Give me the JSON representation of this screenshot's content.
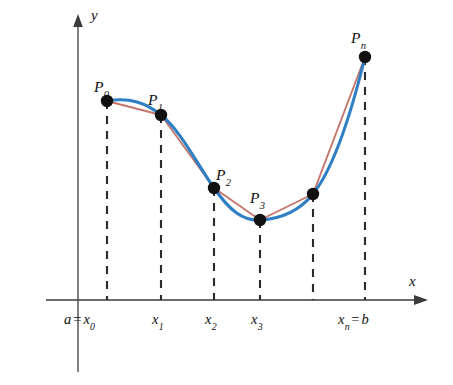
{
  "figure": {
    "background_color": "#ffffff",
    "axis_color": "#3b3b3b",
    "curve_color": "#2f7fc4",
    "chord_color": "#c4766a",
    "point_color": "#111111",
    "dash_color": "#2b2b2b"
  },
  "axes": {
    "y_label": "y",
    "x_label": "x",
    "origin_px": {
      "x": 78,
      "y": 300
    },
    "x_axis_end_px": 425,
    "y_axis_top_px": 18,
    "y_axis_bottom_px": 372
  },
  "points": [
    {
      "name": "P0",
      "label_base": "P",
      "label_sub": "0",
      "x": 107,
      "y": 101,
      "label_x": 94,
      "label_y": 79,
      "labeled": true
    },
    {
      "name": "P1",
      "label_base": "P",
      "label_sub": "1",
      "x": 161,
      "y": 115,
      "label_x": 148,
      "label_y": 92,
      "labeled": true
    },
    {
      "name": "P2",
      "label_base": "P",
      "label_sub": "2",
      "x": 214,
      "y": 188,
      "label_x": 216,
      "label_y": 167,
      "labeled": true
    },
    {
      "name": "P3",
      "label_base": "P",
      "label_sub": "3",
      "x": 260,
      "y": 220,
      "label_x": 250,
      "label_y": 190,
      "labeled": true
    },
    {
      "name": "P4",
      "label_base": "",
      "label_sub": "",
      "x": 313,
      "y": 194,
      "label_x": 0,
      "label_y": 0,
      "labeled": false
    },
    {
      "name": "Pn",
      "label_base": "P",
      "label_sub": "n",
      "x": 365,
      "y": 57,
      "label_x": 351,
      "label_y": 30,
      "labeled": true
    }
  ],
  "x_ticks": [
    {
      "name": "tick-x0",
      "prefix": "a",
      "equals": "=",
      "base": "x",
      "sub": "0",
      "suffix": "",
      "x": 107,
      "label_x": 64,
      "label_y": 312
    },
    {
      "name": "tick-x1",
      "prefix": "",
      "equals": "",
      "base": "x",
      "sub": "1",
      "suffix": "",
      "x": 161,
      "label_x": 152,
      "label_y": 312
    },
    {
      "name": "tick-x2",
      "prefix": "",
      "equals": "",
      "base": "x",
      "sub": "2",
      "suffix": "",
      "x": 214,
      "label_x": 205,
      "label_y": 312
    },
    {
      "name": "tick-x3",
      "prefix": "",
      "equals": "",
      "base": "x",
      "sub": "3",
      "suffix": "",
      "x": 260,
      "label_x": 251,
      "label_y": 312
    },
    {
      "name": "tick-xn",
      "prefix": "",
      "equals": "=",
      "base": "x",
      "sub": "n",
      "suffix": "b",
      "x": 365,
      "label_x": 338,
      "label_y": 312
    }
  ],
  "dashed_verticals": [
    {
      "name": "dash-x0",
      "x": 107,
      "y_top": 101,
      "y_bottom": 300
    },
    {
      "name": "dash-x1",
      "x": 161,
      "y_top": 115,
      "y_bottom": 300
    },
    {
      "name": "dash-x2",
      "x": 214,
      "y_top": 188,
      "y_bottom": 300
    },
    {
      "name": "dash-x3",
      "x": 260,
      "y_top": 220,
      "y_bottom": 300
    },
    {
      "name": "dash-x4",
      "x": 313,
      "y_top": 194,
      "y_bottom": 300
    },
    {
      "name": "dash-xn",
      "x": 365,
      "y_top": 57,
      "y_bottom": 300
    }
  ],
  "chart_data": {
    "type": "line",
    "xlabel": "x",
    "ylabel": "y",
    "grid": false,
    "legend": null,
    "xlim": [
      78,
      425
    ],
    "ylim": [
      300,
      18
    ],
    "series": [
      {
        "name": "smooth-curve",
        "style": "solid-curve",
        "color": "#2f7fc4",
        "path": "M 107 101 C 130 97, 146 103, 161 115 C 180 130, 196 162, 214 188 C 230 211, 243 221, 260 220 C 281 219, 300 210, 313 194 C 334 168, 352 110, 365 57"
      },
      {
        "name": "inscribed-polygon",
        "style": "chords",
        "color": "#c4766a",
        "vertices": [
          [
            107,
            101
          ],
          [
            161,
            115
          ],
          [
            214,
            188
          ],
          [
            260,
            220
          ],
          [
            313,
            194
          ],
          [
            365,
            57
          ]
        ]
      }
    ],
    "annotations": [
      "P0",
      "P1",
      "P2",
      "P3",
      "Pn",
      "a = x0",
      "x1",
      "x2",
      "x3",
      "xn = b"
    ]
  }
}
